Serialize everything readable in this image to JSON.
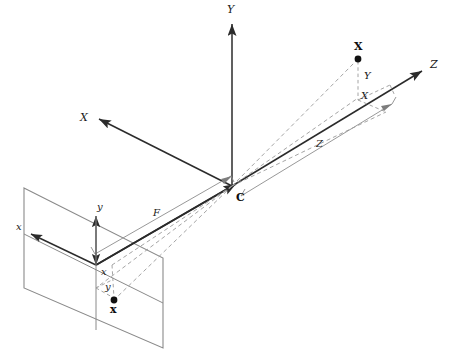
{
  "figure": {
    "background_color": "#ffffff",
    "axis_color": "#2b2b2b",
    "thin_line_color": "#8c8c8c",
    "dashed_line_color": "#9a9a9a",
    "plane_edge_color": "#8a8a8a",
    "point_color": "#111111"
  },
  "labels": {
    "world_x": "X",
    "world_y": "Y",
    "world_z": "Z",
    "camera_center": "C",
    "scene_point": "X",
    "image_point": "x",
    "component_X": "X",
    "component_Y": "Y",
    "component_Z": "Z",
    "focal_length": "F",
    "image_x_axis": "x",
    "image_y_axis": "y",
    "image_offset_x": "x",
    "image_offset_y": "y"
  },
  "geometry": {
    "camera_center": {
      "x": 232,
      "y": 186
    },
    "scene_point": {
      "x": 358,
      "y": 59
    },
    "image_point": {
      "x": 114,
      "y": 300
    },
    "principal_point": {
      "x": 96,
      "y": 265
    },
    "axis_x_tip": {
      "x": 97,
      "y": 119
    },
    "axis_y_tip": {
      "x": 232,
      "y": 22
    },
    "axis_z_tip": {
      "x": 424,
      "y": 70
    },
    "image_plane_corners": [
      {
        "x": 24,
        "y": 188
      },
      {
        "x": 163,
        "y": 258
      },
      {
        "x": 163,
        "y": 348
      },
      {
        "x": 24,
        "y": 288
      }
    ],
    "scene_point_foot": {
      "x": 358,
      "y": 98
    },
    "component_X_end": {
      "x": 386,
      "y": 112
    }
  },
  "label_positions": {
    "world_x": {
      "x": 80,
      "y": 121
    },
    "world_y": {
      "x": 227,
      "y": 13
    },
    "world_z": {
      "x": 430,
      "y": 68
    },
    "camera_center": {
      "x": 236,
      "y": 201
    },
    "scene_point": {
      "x": 354,
      "y": 50
    },
    "image_point": {
      "x": 110,
      "y": 313
    },
    "component_Y": {
      "x": 364,
      "y": 79
    },
    "component_X": {
      "x": 361,
      "y": 99
    },
    "component_Z": {
      "x": 316,
      "y": 147
    },
    "focal_length": {
      "x": 153,
      "y": 216
    },
    "image_x_axis": {
      "x": 16,
      "y": 230
    },
    "image_y_axis": {
      "x": 97,
      "y": 210
    },
    "image_offset_x": {
      "x": 101,
      "y": 275
    },
    "image_offset_y": {
      "x": 105,
      "y": 290
    }
  }
}
